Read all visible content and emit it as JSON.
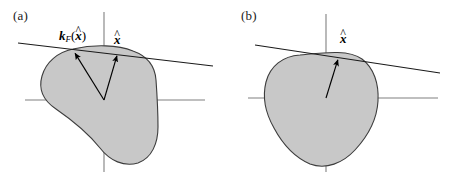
{
  "figure": {
    "type": "diagram",
    "background_color": "#ffffff",
    "blob_fill_color": "#c8c8c8",
    "blob_stroke_color": "#3c3c3c",
    "axis_color": "#808080",
    "tangent_color": "#1a1a1a",
    "arrow_color": "#000000",
    "text_color": "#1a1a1a"
  },
  "panels": [
    {
      "id": "a",
      "label": "(a)",
      "origin": {
        "x": 104,
        "y": 100
      },
      "axes": {
        "horizontal": {
          "x1": 25,
          "y1": 100,
          "x2": 205,
          "y2": 100
        },
        "vertical": {
          "x1": 104,
          "y1": 12,
          "x2": 104,
          "y2": 172
        }
      },
      "tangent_line": {
        "x1": 18,
        "y1": 43,
        "x2": 213,
        "y2": 66
      },
      "vectors": [
        {
          "name": "fermi-momentum-vector",
          "label_text": "k_F(x̂)",
          "from": {
            "x": 104,
            "y": 100
          },
          "to": {
            "x": 73,
            "y": 50
          }
        },
        {
          "name": "direction-unit-vector",
          "label_text": "x̂",
          "from": {
            "x": 104,
            "y": 100
          },
          "to": {
            "x": 118,
            "y": 52
          }
        }
      ],
      "labels": {
        "kf": {
          "symbol": "k",
          "subscript": "F",
          "argument": "x",
          "argument_hat": true
        },
        "xhat": {
          "symbol": "x",
          "hat": true
        }
      }
    },
    {
      "id": "b",
      "label": "(b)",
      "origin": {
        "x": 326,
        "y": 98
      },
      "axes": {
        "horizontal": {
          "x1": 248,
          "y1": 98,
          "x2": 438,
          "y2": 98
        },
        "vertical": {
          "x1": 326,
          "y1": 14,
          "x2": 326,
          "y2": 172
        }
      },
      "tangent_line": {
        "x1": 255,
        "y1": 45,
        "x2": 440,
        "y2": 73
      },
      "vectors": [
        {
          "name": "direction-unit-vector",
          "label_text": "x̂",
          "from": {
            "x": 326,
            "y": 98
          },
          "to": {
            "x": 339,
            "y": 56
          }
        }
      ],
      "labels": {
        "xhat": {
          "symbol": "x",
          "hat": true
        }
      }
    }
  ],
  "shapes": {
    "blob_a_path": "M 73 49 C 58 52, 46 62, 42 76 C 38 90, 44 101, 56 109 C 72 120, 88 133, 100 148 C 110 161, 124 167, 138 163 C 152 158, 158 143, 158 127 C 158 110, 157 94, 156 80 C 155 66, 147 56, 133 51 C 118 45, 95 44, 73 49 Z",
    "blob_b_path": "M 300 55 C 283 56, 270 66, 266 82 C 262 98, 266 114, 274 128 C 282 143, 294 157, 310 164 C 326 170, 343 163, 355 150 C 368 136, 377 119, 378 101 C 379 84, 374 68, 362 59 C 348 49, 322 53, 300 55 Z"
  }
}
